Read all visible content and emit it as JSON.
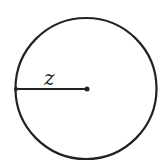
{
  "diagram": {
    "type": "circle-with-radius",
    "circle": {
      "cx": 86,
      "cy": 88.5,
      "r": 70.5,
      "stroke": "#222222",
      "stroke_width": 2.2
    },
    "radius_line": {
      "x1": 16,
      "y1": 89,
      "x2": 87,
      "y2": 89,
      "stroke": "#222222",
      "stroke_width": 2
    },
    "center_point": {
      "cx": 87,
      "cy": 89,
      "r": 2.5
    },
    "edge_point": {
      "cx": 16,
      "cy": 89,
      "r": 2
    },
    "radius_label": {
      "text": "z",
      "x": 44,
      "y": 85
    }
  }
}
